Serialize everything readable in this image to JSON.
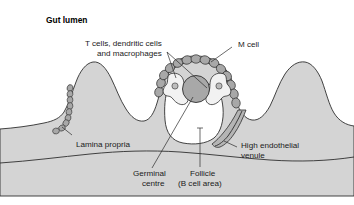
{
  "figure": {
    "title": "Gut lumen",
    "background_color": "#ffffff",
    "tissue_color": "#d4d4d4",
    "cell_color": "#a8a8a8",
    "follicle_color": "#ffffff",
    "outline_color": "#2f2f2f",
    "text_color": "#1a1a1a"
  },
  "labels": {
    "gut_lumen": "Gut lumen",
    "t_cells_line1": "T cells, dendritic cells",
    "t_cells_line2": "and macrophages",
    "m_cell": "M cell",
    "lamina_propria": "Lamina propria",
    "hev_line1": "High endothelial",
    "hev_line2": "venule",
    "germinal_line1": "Germinal",
    "germinal_line2": "centre",
    "follicle_line1": "Follicle",
    "follicle_line2": "(B cell area)"
  },
  "structures": {
    "villi_count": 3,
    "m_cell_count": 14,
    "lamina_propria_cell_count": 9,
    "germinal_centre_shape": "circle",
    "follicle_shape": "rounded-dome",
    "hev_shape": "curved-tube"
  }
}
